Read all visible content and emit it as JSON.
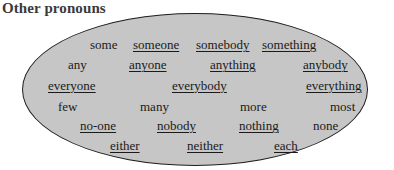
{
  "title": "Other pronouns",
  "colors": {
    "ellipse_fill": "#c6c6c6",
    "ellipse_border": "#1e1e1e",
    "text": "#1a1a1a"
  },
  "rows": [
    [
      {
        "text": "some",
        "underlined": false
      },
      {
        "text": "someone",
        "underlined": true
      },
      {
        "text": "somebody",
        "underlined": true
      },
      {
        "text": "something",
        "underlined": true
      }
    ],
    [
      {
        "text": "any",
        "underlined": false
      },
      {
        "text": "anyone",
        "underlined": true
      },
      {
        "text": "anything",
        "underlined": true
      },
      {
        "text": "anybody",
        "underlined": true
      }
    ],
    [
      {
        "text": "everyone",
        "underlined": true
      },
      {
        "text": "everybody",
        "underlined": true
      },
      {
        "text": "everything",
        "underlined": true
      }
    ],
    [
      {
        "text": "few",
        "underlined": false
      },
      {
        "text": "many",
        "underlined": false
      },
      {
        "text": "more",
        "underlined": false
      },
      {
        "text": "most",
        "underlined": false
      }
    ],
    [
      {
        "text": "no-one",
        "underlined": true
      },
      {
        "text": "nobody",
        "underlined": true
      },
      {
        "text": "nothing",
        "underlined": true
      },
      {
        "text": "none",
        "underlined": false
      }
    ],
    [
      {
        "text": "either",
        "underlined": true
      },
      {
        "text": "neither",
        "underlined": true
      },
      {
        "text": "each",
        "underlined": true
      }
    ]
  ]
}
